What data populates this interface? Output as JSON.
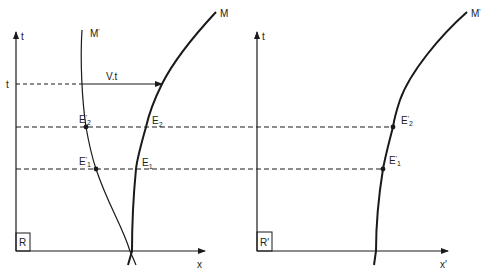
{
  "left_frame": {
    "frame_label": "R",
    "t_axis_label": "t",
    "x_axis_label": "x",
    "t_tick_label": "t",
    "velocity_label": "V.t",
    "worldline_moving": {
      "name": "M",
      "prime": "'"
    },
    "worldline_fixed": {
      "name": "M",
      "prime": "'"
    },
    "events": [
      {
        "name": "E",
        "sub": "2",
        "prime": "'"
      },
      {
        "name": "E",
        "sub": "2",
        "prime": ""
      },
      {
        "name": "E",
        "sub": "1",
        "prime": "'"
      },
      {
        "name": "E",
        "sub": "1",
        "prime": ""
      }
    ],
    "curve_M_label": "M",
    "curve_Mprime_label": "M'"
  },
  "right_frame": {
    "frame_label": "R'",
    "t_axis_label": "t",
    "x_axis_label": "x'",
    "curve_label": "M'",
    "events": [
      {
        "name": "E'",
        "sub": "2"
      },
      {
        "name": "E'",
        "sub": "1"
      }
    ]
  },
  "colors": {
    "line": "#1a1a1a",
    "background": "#ffffff"
  }
}
